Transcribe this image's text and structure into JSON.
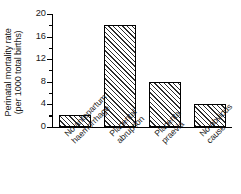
{
  "chart_data": {
    "type": "bar",
    "title": "",
    "subtitle": "",
    "xlabel": "",
    "ylabel": "Perinatal mortality rate (per 1000 total births)",
    "ylabel_lines": [
      "Perinatal mortality rate",
      "(per 1000 total births)"
    ],
    "categories": [
      "No antepartum haemorrhage",
      "Placental abruption",
      "Placenta praevia",
      "No obvious cause"
    ],
    "category_lines": [
      [
        "No antepartum",
        "haemorrhage"
      ],
      [
        "Placental",
        "abruption"
      ],
      [
        "Placenta",
        "praevia"
      ],
      [
        "No obvious",
        "cause"
      ]
    ],
    "values": [
      2,
      18,
      8,
      4
    ],
    "ylim": [
      0,
      20
    ],
    "yticks": [
      0,
      4,
      8,
      12,
      16,
      20
    ],
    "ytick_labels": [
      "0",
      "4",
      "8",
      "12",
      "16",
      "20"
    ],
    "yminor_ticks": [
      2,
      6,
      10,
      14,
      18
    ],
    "grid": false,
    "legend": false,
    "bar_fill": "hatch-diagonal",
    "bar_edge_color": "#000000",
    "axis_color": "#000000",
    "background_color": "#ffffff"
  }
}
